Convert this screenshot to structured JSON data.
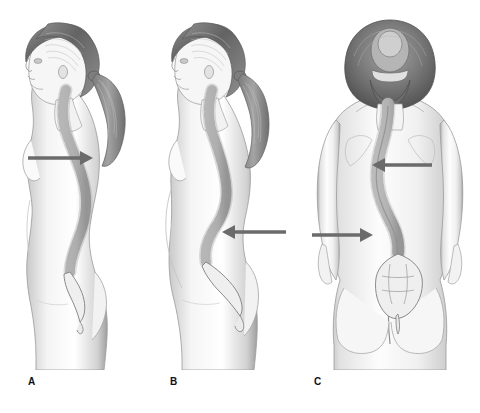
{
  "figure": {
    "background_color": "#ffffff",
    "width": 480,
    "height": 413,
    "panel_count": 3
  },
  "palette": {
    "arrow_color": "#6b6b6b",
    "skin_light": "#fbfbfb",
    "skin_mid": "#d8d8d8",
    "skin_shadow": "#a8a8a8",
    "hair_dark": "#6e6e6e",
    "hair_mid": "#9a9a9a",
    "bone_light": "#ededed",
    "bone_outline": "#6f6f6f",
    "label_color": "#111111"
  },
  "panels": [
    {
      "id": "panel-a",
      "label": "A",
      "view": "lateral-left-profile",
      "subject": "adult-female-standing",
      "condition": "kyphosis",
      "arrow": {
        "direction": "right",
        "target": "thoracic-spine",
        "x_start": 28,
        "x_end": 88,
        "y": 158
      }
    },
    {
      "id": "panel-b",
      "label": "B",
      "view": "lateral-left-profile",
      "subject": "adult-female-standing",
      "condition": "lordosis",
      "arrow": {
        "direction": "left",
        "target": "lumbar-spine",
        "x_start": 286,
        "x_end": 222,
        "y": 232
      }
    },
    {
      "id": "panel-c",
      "label": "C",
      "view": "posterior",
      "subject": "adult-female-standing",
      "condition": "scoliosis",
      "arrows": [
        {
          "direction": "left",
          "target": "thoracic-curve",
          "x_start": 432,
          "x_end": 372,
          "y": 165
        },
        {
          "direction": "right",
          "target": "lumbar-curve",
          "x_start": 312,
          "x_end": 372,
          "y": 235
        }
      ]
    }
  ],
  "labels": {
    "a": "A",
    "b": "B",
    "c": "C"
  }
}
